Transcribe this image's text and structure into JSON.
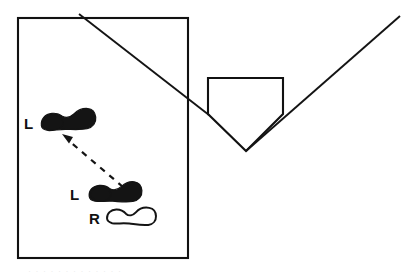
{
  "figure": {
    "background_color": "#ffffff",
    "ink_color": "#141414",
    "width": 416,
    "height": 275
  },
  "labels": {
    "upper_left_print": "L",
    "lower_left_print": "L",
    "right_print": "R"
  },
  "shapes": {
    "room_rect": {
      "name": "floor-area-rectangle",
      "x": 18,
      "y": 18,
      "width": 170,
      "height": 240
    },
    "home_plate": {
      "name": "home-plate-pentagon",
      "points": "208,78 283,78 283,114 246,151 208,114"
    },
    "left_diagonal": {
      "name": "left-diagonal-line",
      "x1": 79,
      "y1": 14,
      "x2": 208,
      "y2": 114
    },
    "right_diagonal": {
      "name": "right-diagonal-line",
      "x1": 246,
      "y1": 151,
      "x2": 400,
      "y2": 16
    }
  },
  "footprints": [
    {
      "id": "upper-left-shoeprint",
      "label": "L",
      "style": "filled",
      "label_x": 24,
      "label_y": 129,
      "cx": 68,
      "cy": 121,
      "rotation": -7
    },
    {
      "id": "lower-left-shoeprint",
      "label": "L",
      "style": "filled",
      "label_x": 70,
      "label_y": 200,
      "cx": 115,
      "cy": 193,
      "rotation": -5
    },
    {
      "id": "right-shoeprint",
      "label": "R",
      "style": "outline",
      "label_x": 89,
      "label_y": 224,
      "cx": 131,
      "cy": 217,
      "rotation": -2
    }
  ],
  "annotation_arrow": {
    "id": "movement-direction-arrow",
    "style": "dashed",
    "from_x": 123,
    "from_y": 187,
    "to_x": 64,
    "to_y": 137
  },
  "footer": {
    "faint_text": "· · · · · · · · · · · · ·"
  }
}
